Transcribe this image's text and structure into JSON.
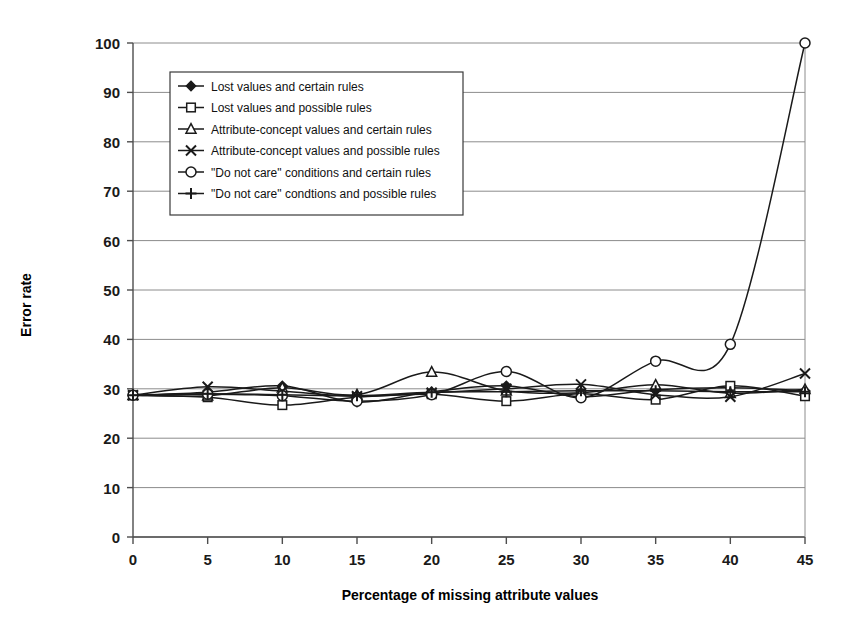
{
  "chart_data": {
    "type": "line",
    "title": "",
    "xlabel": "Percentage of missing attribute values",
    "ylabel": "Error rate",
    "x": [
      0,
      5,
      10,
      15,
      20,
      25,
      30,
      35,
      40,
      45
    ],
    "xlim": [
      0,
      45
    ],
    "ylim": [
      0,
      100
    ],
    "xticks": [
      "0",
      "5",
      "10",
      "15",
      "20",
      "25",
      "30",
      "35",
      "40",
      "45"
    ],
    "yticks": [
      "0",
      "10",
      "20",
      "30",
      "40",
      "50",
      "60",
      "70",
      "80",
      "90",
      "100"
    ],
    "grid": "horizontal",
    "legend_position": "upper-left-inside",
    "series": [
      {
        "name": "Lost values and certain rules",
        "marker": "filled-diamond",
        "values": [
          28.7,
          29.3,
          30.6,
          27.3,
          29.4,
          30.6,
          28.4,
          29.8,
          30.2,
          29.6
        ]
      },
      {
        "name": "Lost values and possible rules",
        "marker": "open-square",
        "values": [
          28.7,
          28.3,
          26.7,
          28.3,
          28.9,
          27.5,
          29.0,
          27.8,
          30.6,
          28.5
        ]
      },
      {
        "name": "Attribute-concept values and certain rules",
        "marker": "open-triangle",
        "values": [
          28.7,
          28.6,
          30.2,
          28.8,
          33.4,
          29.6,
          29.2,
          30.8,
          29.1,
          29.9
        ]
      },
      {
        "name": "Attribute-concept values and possible rules",
        "marker": "cross-x",
        "values": [
          28.7,
          30.4,
          29.5,
          28.5,
          29.2,
          30.0,
          30.9,
          28.8,
          28.4,
          33.1
        ]
      },
      {
        "name": "\"Do not care\" conditions and certain rules",
        "marker": "open-circle",
        "values": [
          28.7,
          28.9,
          28.6,
          27.5,
          28.8,
          33.5,
          28.2,
          35.6,
          39.0,
          100.0
        ]
      },
      {
        "name": "\"Do not care\" condtions and possible rules",
        "marker": "plus",
        "values": [
          28.7,
          29.0,
          28.8,
          28.6,
          29.3,
          29.4,
          29.6,
          29.6,
          29.4,
          29.4
        ]
      }
    ]
  },
  "colors": {
    "line": "#1a1a1a",
    "grid": "#8c8c8c",
    "axis": "#4d4d4d",
    "background": "#ffffff",
    "legend_border": "#3a3a3a"
  }
}
